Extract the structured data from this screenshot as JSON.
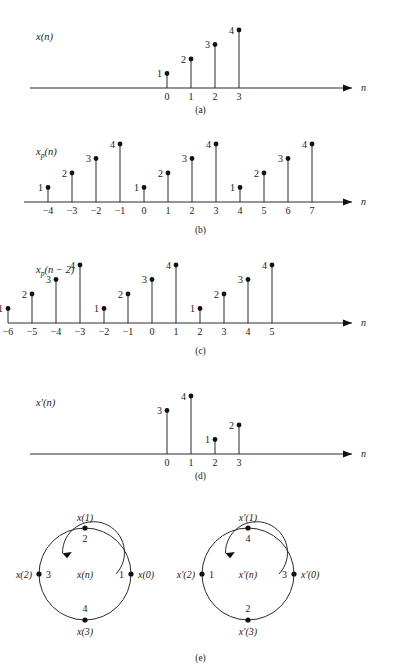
{
  "figure": {
    "axis_label": "n",
    "captions": {
      "a": "(a)",
      "b": "(b)",
      "c": "(c)",
      "d": "(d)",
      "e": "(e)"
    }
  },
  "chart_data": [
    {
      "type": "stem",
      "panel": "(a)",
      "title": "x(n)",
      "signal_base": "x",
      "signal_sub": "",
      "signal_arg": "(n)",
      "xlabel": "n",
      "ylabel": "",
      "x": [
        0,
        1,
        2,
        3
      ],
      "values": [
        1,
        2,
        3,
        4
      ],
      "tick_labels": [
        "0",
        "1",
        "2",
        "3"
      ],
      "xlim": [
        -0.6,
        9.5
      ],
      "ylim": [
        0,
        4
      ],
      "grid": false,
      "legend": "none"
    },
    {
      "type": "stem",
      "panel": "(b)",
      "title": "xp(n)",
      "signal_base": "x",
      "signal_sub": "p",
      "signal_arg": "(n)",
      "xlabel": "n",
      "ylabel": "",
      "x": [
        -4,
        -3,
        -2,
        -1,
        0,
        1,
        2,
        3,
        4,
        5,
        6,
        7
      ],
      "values": [
        1,
        2,
        3,
        4,
        1,
        2,
        3,
        4,
        1,
        2,
        3,
        4
      ],
      "tick_labels": [
        "−4",
        "−3",
        "−2",
        "−1",
        "0",
        "1",
        "2",
        "3",
        "4",
        "5",
        "6",
        "7"
      ],
      "xlim": [
        -5,
        9.5
      ],
      "ylim": [
        0,
        4
      ],
      "grid": false,
      "legend": "none"
    },
    {
      "type": "stem",
      "panel": "(c)",
      "title": "xp(n − 2)",
      "signal_base": "x",
      "signal_sub": "p",
      "signal_arg": "(n − 2)",
      "xlabel": "n",
      "ylabel": "",
      "x": [
        -6,
        -5,
        -4,
        -3,
        -2,
        -1,
        0,
        1,
        2,
        3,
        4,
        5
      ],
      "values": [
        1,
        2,
        3,
        4,
        1,
        2,
        3,
        4,
        1,
        2,
        3,
        4
      ],
      "tick_labels": [
        "−6",
        "−5",
        "−4",
        "−3",
        "−2",
        "−1",
        "0",
        "1",
        "2",
        "3",
        "4",
        "5"
      ],
      "xlim": [
        -7,
        7.5
      ],
      "ylim": [
        0,
        4
      ],
      "grid": false,
      "legend": "none"
    },
    {
      "type": "stem",
      "panel": "(d)",
      "title": "x′(n)",
      "signal_base": "x",
      "signal_sub": "",
      "signal_arg": "′(n)",
      "xlabel": "n",
      "ylabel": "",
      "x": [
        0,
        1,
        2,
        3
      ],
      "values": [
        3,
        4,
        1,
        2
      ],
      "tick_labels": [
        "0",
        "1",
        "2",
        "3"
      ],
      "xlim": [
        -0.6,
        9.5
      ],
      "ylim": [
        0,
        4
      ],
      "grid": false,
      "legend": "none"
    },
    {
      "type": "circular",
      "panel": "(e)",
      "title": "x(n)",
      "center_label": "x(n)",
      "direction": "counterclockwise",
      "points": [
        {
          "position": "right",
          "index_label": "x(0)",
          "value": "1"
        },
        {
          "position": "top",
          "index_label": "x(1)",
          "value": "2"
        },
        {
          "position": "left",
          "index_label": "x(2)",
          "value": "3"
        },
        {
          "position": "bottom",
          "index_label": "x(3)",
          "value": "4"
        }
      ]
    },
    {
      "type": "circular",
      "panel": "(e)",
      "title": "x′(n)",
      "center_label": "x′(n)",
      "direction": "counterclockwise",
      "points": [
        {
          "position": "right",
          "index_label": "x′(0)",
          "value": "3"
        },
        {
          "position": "top",
          "index_label": "x′(1)",
          "value": "4"
        },
        {
          "position": "left",
          "index_label": "x′(2)",
          "value": "1"
        },
        {
          "position": "bottom",
          "index_label": "x′(3)",
          "value": "2"
        }
      ]
    }
  ]
}
